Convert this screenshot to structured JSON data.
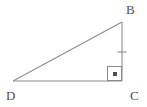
{
  "figure": {
    "type": "geometry-diagram",
    "shape": "right-triangle",
    "background_color": "#ffffff",
    "stroke_color": "#8c8c8c",
    "label_color": "#4d4d4d",
    "stroke_width": 1,
    "vertices": [
      {
        "name": "B",
        "label": "B",
        "x": 122,
        "y": 22,
        "label_x": 126,
        "label_y": 3
      },
      {
        "name": "C",
        "label": "C",
        "x": 122,
        "y": 81,
        "label_x": 130,
        "label_y": 89
      },
      {
        "name": "D",
        "label": "D",
        "x": 13,
        "y": 81,
        "label_x": 6,
        "label_y": 89
      }
    ],
    "segments": [
      {
        "name": "hypotenuse-DB",
        "from": "D",
        "to": "B",
        "x1": 13,
        "y1": 81,
        "x2": 122,
        "y2": 22
      },
      {
        "name": "leg-BC",
        "from": "B",
        "to": "C",
        "x1": 122,
        "y1": 22,
        "x2": 122,
        "y2": 81
      },
      {
        "name": "leg-DC",
        "from": "D",
        "to": "C",
        "x1": 13,
        "y1": 81,
        "x2": 122,
        "y2": 81
      }
    ],
    "right_angle_marker": {
      "at_vertex": "C",
      "x": 107,
      "y": 66,
      "size": 15,
      "has_center_dot": true,
      "dot_size": 4
    },
    "tick_marks": [
      {
        "on_segment": "leg-BC",
        "count": 1,
        "x": 122,
        "y": 52,
        "length": 9,
        "orientation": "horizontal"
      }
    ]
  }
}
